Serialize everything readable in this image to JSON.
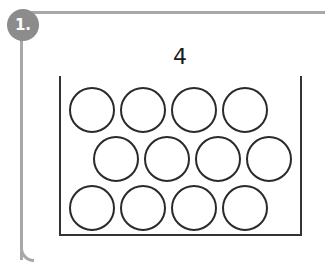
{
  "badge": {
    "label": "1."
  },
  "prompt": {
    "number": "4"
  },
  "colors": {
    "frame": "#a8a8a8",
    "badge": "#8c8c8c",
    "stroke": "#2a2a2a"
  },
  "counters": {
    "total": 12,
    "rows": [
      {
        "count": 4,
        "x": [
          69,
          120,
          171,
          222
        ],
        "y": 87
      },
      {
        "count": 4,
        "x": [
          93,
          144,
          195,
          246
        ],
        "y": 136
      },
      {
        "count": 4,
        "x": [
          69,
          120,
          171,
          222
        ],
        "y": 185
      }
    ]
  }
}
